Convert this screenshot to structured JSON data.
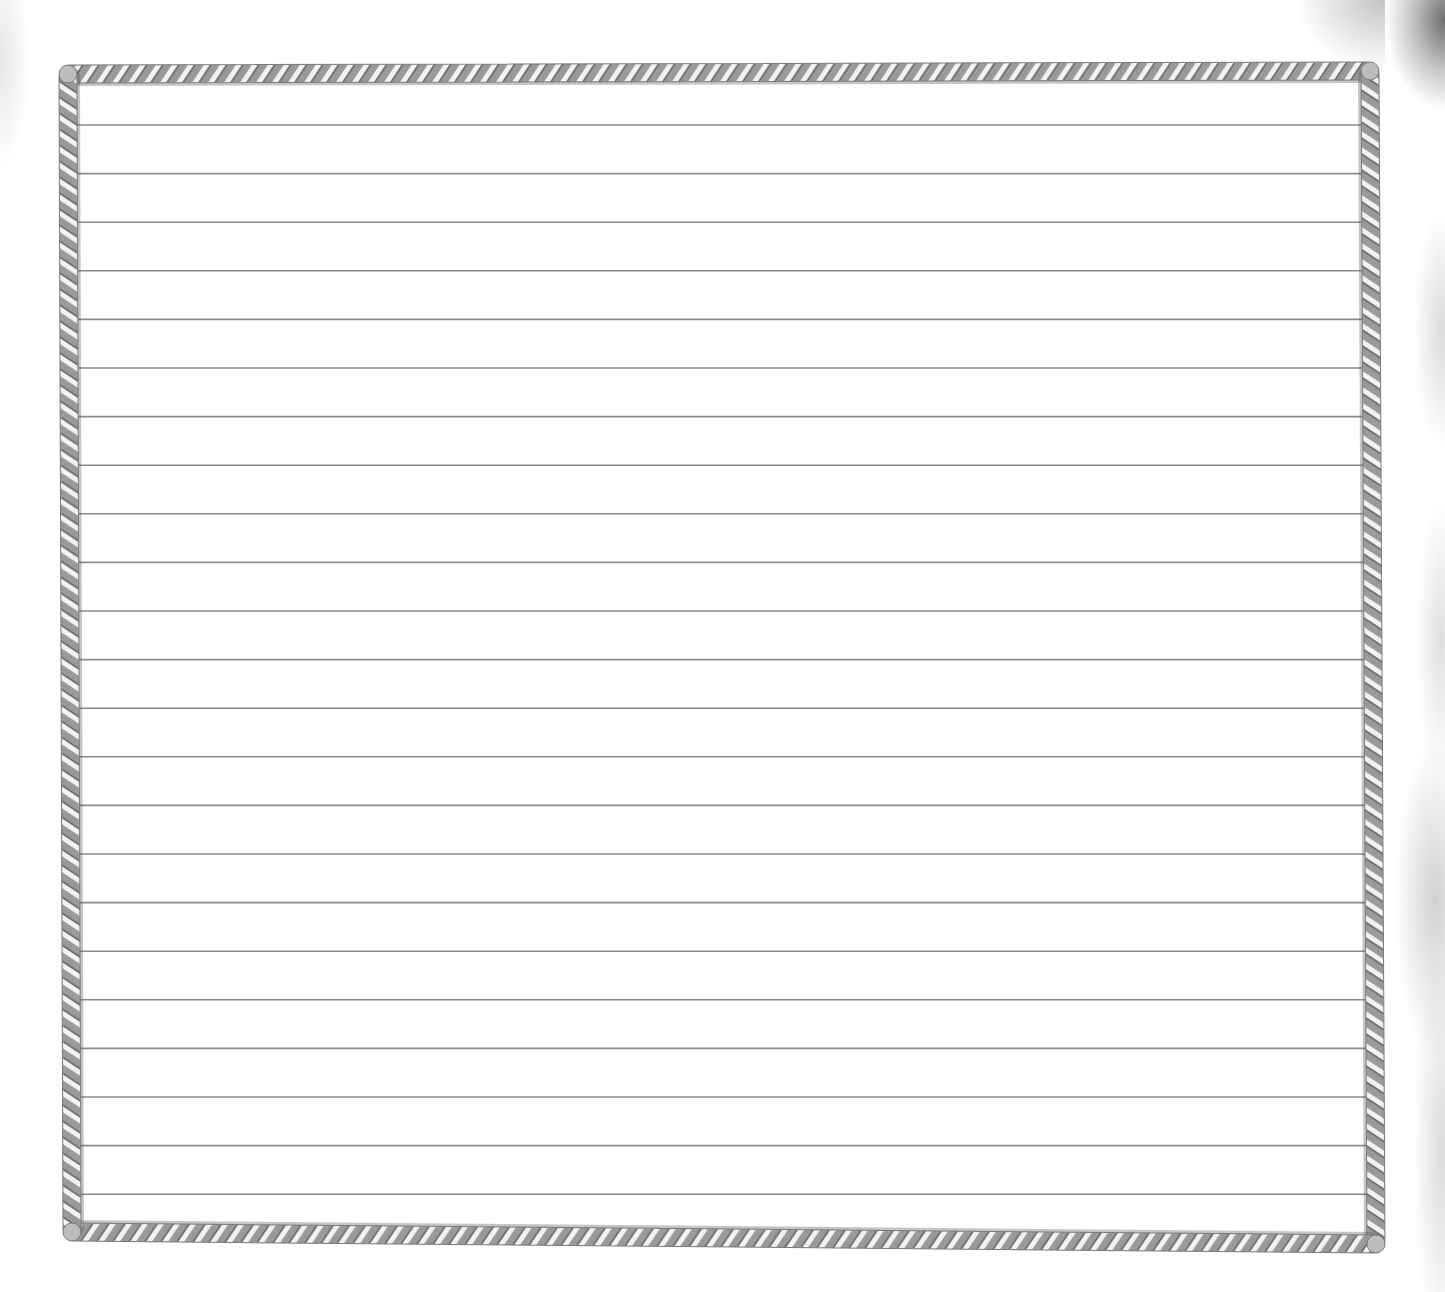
{
  "page": {
    "type": "lined-writing-paper",
    "title_partial": "",
    "background_color": "#ffffff"
  },
  "frame": {
    "style": "twisted-rope-border",
    "rope_color_light": "#e6e6e6",
    "rope_color_dark": "#7a7a7a",
    "corners": {
      "top_left": [
        68,
        74
      ],
      "top_right": [
        1370,
        71
      ],
      "bottom_right": [
        1376,
        1244
      ],
      "bottom_left": [
        72,
        1232
      ]
    }
  },
  "ruled_lines": {
    "count": 23,
    "color": "#8a8a8a",
    "first_y": 125,
    "spacing": 48.6,
    "x_start": 77,
    "x_end": 1366
  },
  "decoration": {
    "grunge_texture": [
      "top-left",
      "right-edge",
      "top-right-corner"
    ]
  }
}
